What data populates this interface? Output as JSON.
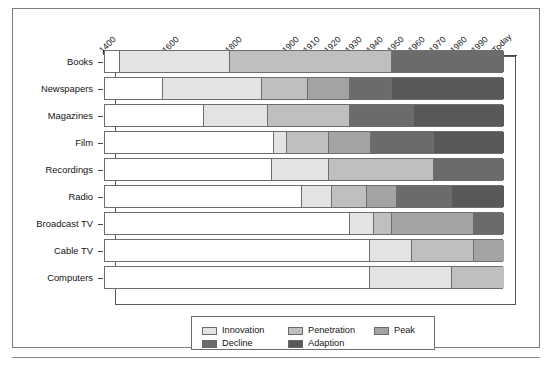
{
  "chart_data": {
    "type": "bar",
    "subtype": "stacked-horizontal-timeline",
    "title": "",
    "xlabel": "",
    "ylabel": "",
    "grid": false,
    "legend_position": "bottom-center",
    "axis": {
      "orientation": "top",
      "tick_labels": [
        "1400",
        "1600",
        "1800",
        "1900",
        "1910",
        "1920",
        "1930",
        "1940",
        "1950",
        "1960",
        "1970",
        "1980",
        "1990",
        "Today"
      ],
      "tick_values": [
        1400,
        1600,
        1800,
        1900,
        1910,
        1920,
        1930,
        1940,
        1950,
        1960,
        1970,
        1980,
        1990,
        2000
      ],
      "tick_positions_px": [
        102,
        165,
        228,
        285,
        306,
        327,
        348,
        369,
        390,
        411,
        432,
        453,
        474,
        495
      ],
      "label_rotation_deg": -45,
      "range_start": 1400,
      "range_end": "Today"
    },
    "categories": [
      "Books",
      "Newspapers",
      "Magazines",
      "Film",
      "Recordings",
      "Radio",
      "Broadcast TV",
      "Cable TV",
      "Computers"
    ],
    "phases": [
      "Innovation",
      "Penetration",
      "Peak",
      "Decline",
      "Adaption"
    ],
    "phase_colors": {
      "Innovation": "#e3e3e3",
      "Penetration": "#bfbfbf",
      "Peak": "#a3a3a3",
      "Decline": "#6b6b6b",
      "Adaption": "#585858",
      "Empty": "#ffffff"
    },
    "series": [
      {
        "name": "Books",
        "segments": [
          {
            "phase": "Empty",
            "start_px": 103,
            "end_px": 118
          },
          {
            "phase": "Innovation",
            "start_px": 118,
            "end_px": 228
          },
          {
            "phase": "Penetration",
            "start_px": 228,
            "end_px": 390
          },
          {
            "phase": "Decline",
            "start_px": 390,
            "end_px": 502
          }
        ]
      },
      {
        "name": "Newspapers",
        "segments": [
          {
            "phase": "Empty",
            "start_px": 103,
            "end_px": 161
          },
          {
            "phase": "Innovation",
            "start_px": 161,
            "end_px": 260
          },
          {
            "phase": "Penetration",
            "start_px": 260,
            "end_px": 306
          },
          {
            "phase": "Peak",
            "start_px": 306,
            "end_px": 348
          },
          {
            "phase": "Decline",
            "start_px": 348,
            "end_px": 390
          },
          {
            "phase": "Adaption",
            "start_px": 390,
            "end_px": 502
          }
        ]
      },
      {
        "name": "Magazines",
        "segments": [
          {
            "phase": "Empty",
            "start_px": 103,
            "end_px": 202
          },
          {
            "phase": "Innovation",
            "start_px": 202,
            "end_px": 266
          },
          {
            "phase": "Penetration",
            "start_px": 266,
            "end_px": 348
          },
          {
            "phase": "Decline",
            "start_px": 348,
            "end_px": 412
          },
          {
            "phase": "Adaption",
            "start_px": 412,
            "end_px": 502
          }
        ]
      },
      {
        "name": "Film",
        "segments": [
          {
            "phase": "Empty",
            "start_px": 103,
            "end_px": 272
          },
          {
            "phase": "Innovation",
            "start_px": 272,
            "end_px": 285
          },
          {
            "phase": "Penetration",
            "start_px": 285,
            "end_px": 327
          },
          {
            "phase": "Peak",
            "start_px": 327,
            "end_px": 369
          },
          {
            "phase": "Decline",
            "start_px": 369,
            "end_px": 432
          },
          {
            "phase": "Adaption",
            "start_px": 432,
            "end_px": 502
          }
        ]
      },
      {
        "name": "Recordings",
        "segments": [
          {
            "phase": "Empty",
            "start_px": 103,
            "end_px": 270
          },
          {
            "phase": "Innovation",
            "start_px": 270,
            "end_px": 327
          },
          {
            "phase": "Penetration",
            "start_px": 327,
            "end_px": 432
          },
          {
            "phase": "Decline",
            "start_px": 432,
            "end_px": 502
          }
        ]
      },
      {
        "name": "Radio",
        "segments": [
          {
            "phase": "Empty",
            "start_px": 103,
            "end_px": 300
          },
          {
            "phase": "Innovation",
            "start_px": 300,
            "end_px": 330
          },
          {
            "phase": "Penetration",
            "start_px": 330,
            "end_px": 365
          },
          {
            "phase": "Peak",
            "start_px": 365,
            "end_px": 395
          },
          {
            "phase": "Decline",
            "start_px": 395,
            "end_px": 450
          },
          {
            "phase": "Adaption",
            "start_px": 450,
            "end_px": 502
          }
        ]
      },
      {
        "name": "Broadcast TV",
        "segments": [
          {
            "phase": "Empty",
            "start_px": 103,
            "end_px": 348
          },
          {
            "phase": "Innovation",
            "start_px": 348,
            "end_px": 372
          },
          {
            "phase": "Penetration",
            "start_px": 372,
            "end_px": 390
          },
          {
            "phase": "Peak",
            "start_px": 390,
            "end_px": 472
          },
          {
            "phase": "Decline",
            "start_px": 472,
            "end_px": 502
          }
        ]
      },
      {
        "name": "Cable TV",
        "segments": [
          {
            "phase": "Empty",
            "start_px": 103,
            "end_px": 368
          },
          {
            "phase": "Innovation",
            "start_px": 368,
            "end_px": 410
          },
          {
            "phase": "Penetration",
            "start_px": 410,
            "end_px": 472
          },
          {
            "phase": "Peak",
            "start_px": 472,
            "end_px": 502
          }
        ]
      },
      {
        "name": "Computers",
        "segments": [
          {
            "phase": "Empty",
            "start_px": 103,
            "end_px": 368
          },
          {
            "phase": "Innovation",
            "start_px": 368,
            "end_px": 450
          },
          {
            "phase": "Penetration",
            "start_px": 450,
            "end_px": 502
          }
        ]
      }
    ],
    "legend": {
      "entries": [
        {
          "label": "Innovation",
          "color": "#e3e3e3"
        },
        {
          "label": "Penetration",
          "color": "#bfbfbf"
        },
        {
          "label": "Peak",
          "color": "#a3a3a3"
        },
        {
          "label": "Decline",
          "color": "#6b6b6b"
        },
        {
          "label": "Adaption",
          "color": "#585858"
        }
      ]
    }
  }
}
